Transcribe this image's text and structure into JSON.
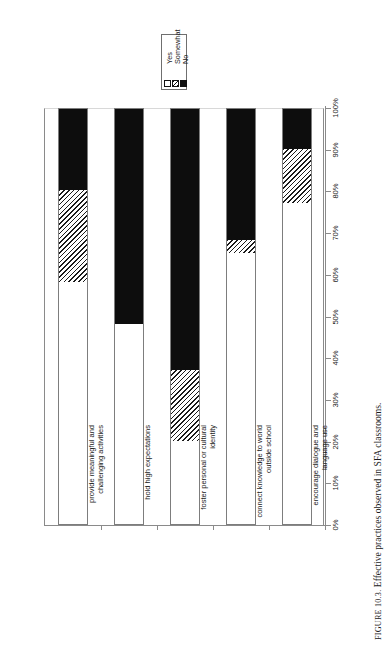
{
  "caption": {
    "number": "FIGURE 10.3.",
    "text": "Effective practices observed in SFA classrooms."
  },
  "legend": {
    "items": [
      {
        "label": "Yes",
        "swatch": "white-square-icon",
        "color": "#ffffff"
      },
      {
        "label": "Somewhat",
        "swatch": "hatched-square-icon",
        "color": "#1a1a1a"
      },
      {
        "label": "No",
        "swatch": "black-square-icon",
        "color": "#0d0d0d"
      }
    ]
  },
  "axis": {
    "tick_labels": [
      "0%",
      "10%",
      "20%",
      "30%",
      "40%",
      "50%",
      "60%",
      "70%",
      "80%",
      "90%",
      "100%"
    ]
  },
  "chart_data": {
    "type": "bar",
    "orientation": "vertical-stacked-100",
    "title": "",
    "xlabel": "",
    "ylabel": "",
    "ylim": [
      0,
      100
    ],
    "grid": false,
    "legend_position": "top-left",
    "categories": [
      "provide meaningful and challenging activities",
      "hold high expectations",
      "foster personal or cultural identity",
      "connect knowledge to world outside school",
      "encourage dialogue and language use"
    ],
    "series": [
      {
        "name": "Yes",
        "values": [
          58,
          48,
          20,
          65,
          77
        ]
      },
      {
        "name": "Somewhat",
        "values": [
          22,
          0,
          17,
          3,
          13
        ]
      },
      {
        "name": "No",
        "values": [
          20,
          52,
          63,
          32,
          10
        ]
      }
    ]
  }
}
